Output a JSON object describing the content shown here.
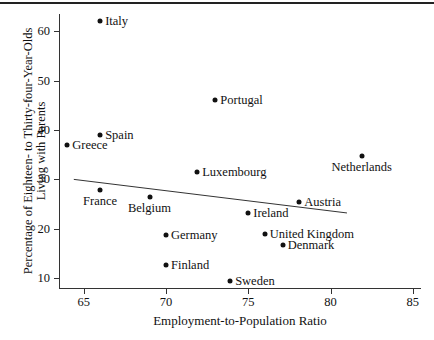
{
  "chart_data": {
    "type": "scatter",
    "title": "",
    "xlabel": "Employment-to-Population Ratio",
    "ylabel": "Percentage of Eighteen- to Thirty-four-Year-Olds Living with Parents",
    "xlim": [
      63.5,
      85.5
    ],
    "ylim": [
      8.0,
      63.5
    ],
    "xticks": [
      65,
      70,
      75,
      80,
      85
    ],
    "yticks": [
      10,
      20,
      30,
      40,
      50,
      60
    ],
    "grid": false,
    "legend": "none",
    "points": [
      {
        "label": "Italy",
        "x": 66.0,
        "y": 62.1,
        "label_pos": "right"
      },
      {
        "label": "Portugal",
        "x": 73.0,
        "y": 46.1,
        "label_pos": "right"
      },
      {
        "label": "Spain",
        "x": 66.0,
        "y": 39.0,
        "label_pos": "right"
      },
      {
        "label": "Greece",
        "x": 64.0,
        "y": 37.0,
        "label_pos": "right"
      },
      {
        "label": "Netherlands",
        "x": 81.9,
        "y": 34.7,
        "label_pos": "below"
      },
      {
        "label": "Luxembourg",
        "x": 71.9,
        "y": 31.4,
        "label_pos": "right"
      },
      {
        "label": "France",
        "x": 66.0,
        "y": 27.8,
        "label_pos": "below"
      },
      {
        "label": "Belgium",
        "x": 69.0,
        "y": 26.5,
        "label_pos": "below"
      },
      {
        "label": "Austria",
        "x": 78.1,
        "y": 25.5,
        "label_pos": "right"
      },
      {
        "label": "Ireland",
        "x": 75.0,
        "y": 23.2,
        "label_pos": "right"
      },
      {
        "label": "United Kingdom",
        "x": 76.0,
        "y": 18.9,
        "label_pos": "right"
      },
      {
        "label": "Germany",
        "x": 70.0,
        "y": 18.7,
        "label_pos": "right"
      },
      {
        "label": "Denmark",
        "x": 77.1,
        "y": 16.8,
        "label_pos": "right"
      },
      {
        "label": "Finland",
        "x": 70.0,
        "y": 12.6,
        "label_pos": "right"
      },
      {
        "label": "Sweden",
        "x": 73.9,
        "y": 9.5,
        "label_pos": "right"
      }
    ],
    "trendline": {
      "x_start": 64.4,
      "y_start": 30.0,
      "x_end": 81.0,
      "y_end": 23.2,
      "color": "#333333"
    }
  }
}
